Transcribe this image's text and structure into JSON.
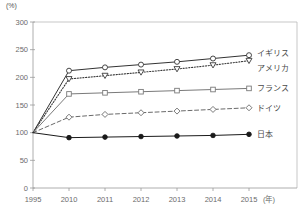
{
  "chart_data": {
    "type": "line",
    "title": "",
    "xlabel": "(年)",
    "ylabel": "(%)",
    "x": [
      "1995",
      "2010",
      "2011",
      "2012",
      "2013",
      "2014",
      "2015"
    ],
    "categories": [
      "1995",
      "2010",
      "2011",
      "2012",
      "2013",
      "2014",
      "2015"
    ],
    "ylim": [
      0,
      300
    ],
    "yticks": [
      0,
      50,
      100,
      150,
      200,
      250,
      300
    ],
    "ytick_labels": [
      "0",
      "50",
      "100",
      "150",
      "200",
      "250",
      "300"
    ],
    "grid": false,
    "legend_position": "right-inline",
    "series": [
      {
        "name": "イギリス",
        "values": [
          100,
          212,
          218,
          223,
          228,
          234,
          240
        ],
        "marker": "open-circle",
        "line_style": "solid",
        "color": "#333333"
      },
      {
        "name": "アメリカ",
        "values": [
          100,
          197,
          203,
          209,
          215,
          222,
          230
        ],
        "marker": "open-triangle-down",
        "line_style": "dotted",
        "color": "#3a3a3a"
      },
      {
        "name": "フランス",
        "values": [
          100,
          170,
          172,
          174,
          176,
          178,
          180
        ],
        "marker": "open-square",
        "line_style": "solid",
        "color": "#7a7a7a"
      },
      {
        "name": "ドイツ",
        "values": [
          100,
          128,
          133,
          136,
          139,
          142,
          145
        ],
        "marker": "open-diamond",
        "line_style": "dashed",
        "color": "#6a6a6a"
      },
      {
        "name": "日本",
        "values": [
          100,
          91,
          92,
          93,
          94,
          95,
          97
        ],
        "marker": "filled-circle",
        "line_style": "solid",
        "color": "#1a1a1a"
      }
    ]
  },
  "axes": {
    "y_unit": "(%)",
    "x_unit": "(年)"
  },
  "legend": {
    "items": [
      {
        "label": "イギリス"
      },
      {
        "label": "アメリカ"
      },
      {
        "label": "フランス"
      },
      {
        "label": "ドイツ"
      },
      {
        "label": "日本"
      }
    ]
  }
}
